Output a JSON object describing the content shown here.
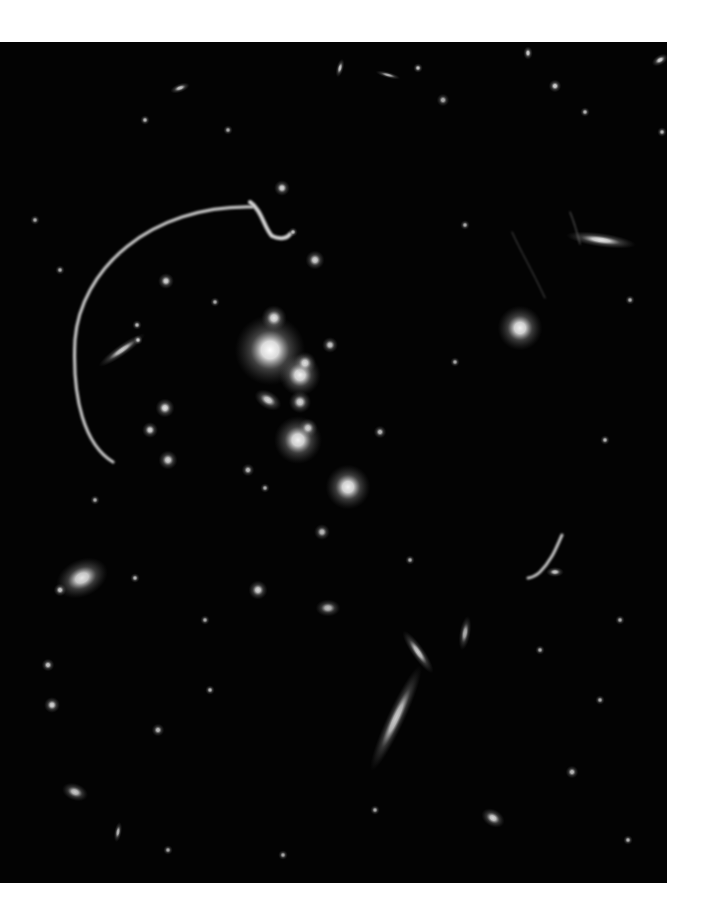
{
  "image": {
    "subject": "galaxy cluster with gravitational lensing arcs",
    "background_color": "#030303",
    "page_color": "#ffffff",
    "frame": {
      "x": 0,
      "y": 42,
      "width": 667,
      "height": 841
    }
  },
  "galaxies": [
    {
      "x": 270,
      "y": 350,
      "r": 22,
      "rx": 1,
      "ry": 1,
      "rot": 0,
      "b": 1.0
    },
    {
      "x": 300,
      "y": 375,
      "r": 13,
      "rx": 1,
      "ry": 1,
      "rot": 0,
      "b": 0.95
    },
    {
      "x": 298,
      "y": 440,
      "r": 15,
      "rx": 1,
      "ry": 1,
      "rot": 0,
      "b": 0.95
    },
    {
      "x": 348,
      "y": 487,
      "r": 14,
      "rx": 1,
      "ry": 1,
      "rot": 0,
      "b": 0.95
    },
    {
      "x": 520,
      "y": 328,
      "r": 14,
      "rx": 1,
      "ry": 1,
      "rot": 0,
      "b": 0.95
    },
    {
      "x": 274,
      "y": 318,
      "r": 8,
      "rx": 1,
      "ry": 1,
      "rot": 0,
      "b": 0.9
    },
    {
      "x": 305,
      "y": 363,
      "r": 7,
      "rx": 1,
      "ry": 1,
      "rot": 0,
      "b": 0.85
    },
    {
      "x": 268,
      "y": 400,
      "r": 7,
      "rx": 1.3,
      "ry": 0.8,
      "rot": 30,
      "b": 0.85
    },
    {
      "x": 300,
      "y": 402,
      "r": 7,
      "rx": 1,
      "ry": 1,
      "rot": 0,
      "b": 0.85
    },
    {
      "x": 308,
      "y": 428,
      "r": 6,
      "rx": 1,
      "ry": 1,
      "rot": 0,
      "b": 0.8
    },
    {
      "x": 330,
      "y": 345,
      "r": 5,
      "rx": 1,
      "ry": 1,
      "rot": 0,
      "b": 0.8
    },
    {
      "x": 165,
      "y": 408,
      "r": 6,
      "rx": 1,
      "ry": 1,
      "rot": 0,
      "b": 0.9
    },
    {
      "x": 150,
      "y": 430,
      "r": 5,
      "rx": 1,
      "ry": 1,
      "rot": 0,
      "b": 0.85
    },
    {
      "x": 168,
      "y": 460,
      "r": 6,
      "rx": 1,
      "ry": 1,
      "rot": 0,
      "b": 0.85
    },
    {
      "x": 166,
      "y": 281,
      "r": 5,
      "rx": 1,
      "ry": 1,
      "rot": 0,
      "b": 0.85
    },
    {
      "x": 122,
      "y": 350,
      "r": 8,
      "rx": 2.2,
      "ry": 0.45,
      "rot": -35,
      "b": 0.8
    },
    {
      "x": 138,
      "y": 340,
      "r": 3,
      "rx": 1,
      "ry": 1,
      "rot": 0,
      "b": 0.8
    },
    {
      "x": 137,
      "y": 325,
      "r": 3,
      "rx": 1,
      "ry": 1,
      "rot": 0,
      "b": 0.75
    },
    {
      "x": 215,
      "y": 302,
      "r": 3,
      "rx": 1,
      "ry": 1,
      "rot": 0,
      "b": 0.7
    },
    {
      "x": 315,
      "y": 260,
      "r": 6,
      "rx": 1,
      "ry": 1,
      "rot": 0,
      "b": 0.85
    },
    {
      "x": 282,
      "y": 188,
      "r": 5,
      "rx": 1,
      "ry": 1,
      "rot": 0,
      "b": 0.85
    },
    {
      "x": 293,
      "y": 232,
      "r": 3,
      "rx": 1,
      "ry": 1,
      "rot": 0,
      "b": 0.75
    },
    {
      "x": 82,
      "y": 578,
      "r": 13,
      "rx": 1.3,
      "ry": 0.9,
      "rot": -25,
      "b": 0.9
    },
    {
      "x": 60,
      "y": 590,
      "r": 4,
      "rx": 1,
      "ry": 1,
      "rot": 0,
      "b": 0.8
    },
    {
      "x": 135,
      "y": 578,
      "r": 3,
      "rx": 1,
      "ry": 1,
      "rot": 0,
      "b": 0.75
    },
    {
      "x": 601,
      "y": 240,
      "r": 10,
      "rx": 2.2,
      "ry": 0.45,
      "rot": 8,
      "b": 0.9
    },
    {
      "x": 396,
      "y": 718,
      "r": 14,
      "rx": 2.6,
      "ry": 0.4,
      "rot": -65,
      "b": 0.8
    },
    {
      "x": 418,
      "y": 652,
      "r": 8,
      "rx": 2.0,
      "ry": 0.5,
      "rot": 55,
      "b": 0.8
    },
    {
      "x": 465,
      "y": 633,
      "r": 6,
      "rx": 0.6,
      "ry": 1.8,
      "rot": 10,
      "b": 0.7
    },
    {
      "x": 555,
      "y": 572,
      "r": 4,
      "rx": 1.4,
      "ry": 0.8,
      "rot": 0,
      "b": 0.8
    },
    {
      "x": 258,
      "y": 590,
      "r": 6,
      "rx": 1,
      "ry": 1,
      "rot": 0,
      "b": 0.85
    },
    {
      "x": 328,
      "y": 608,
      "r": 6,
      "rx": 1.3,
      "ry": 0.9,
      "rot": 0,
      "b": 0.75
    },
    {
      "x": 322,
      "y": 532,
      "r": 5,
      "rx": 1,
      "ry": 1,
      "rot": 0,
      "b": 0.75
    },
    {
      "x": 380,
      "y": 432,
      "r": 4,
      "rx": 1,
      "ry": 1,
      "rot": 0,
      "b": 0.75
    },
    {
      "x": 180,
      "y": 88,
      "r": 4,
      "rx": 1.6,
      "ry": 0.7,
      "rot": -20,
      "b": 0.8
    },
    {
      "x": 340,
      "y": 68,
      "r": 4,
      "rx": 0.6,
      "ry": 1.5,
      "rot": 15,
      "b": 0.8
    },
    {
      "x": 388,
      "y": 75,
      "r": 4,
      "rx": 2.0,
      "ry": 0.5,
      "rot": 15,
      "b": 0.7
    },
    {
      "x": 418,
      "y": 68,
      "r": 3,
      "rx": 1,
      "ry": 1,
      "rot": 0,
      "b": 0.8
    },
    {
      "x": 528,
      "y": 53,
      "r": 3,
      "rx": 1,
      "ry": 1.4,
      "rot": 0,
      "b": 0.85
    },
    {
      "x": 660,
      "y": 60,
      "r": 4,
      "rx": 1.4,
      "ry": 0.8,
      "rot": -30,
      "b": 0.85
    },
    {
      "x": 555,
      "y": 86,
      "r": 4,
      "rx": 1,
      "ry": 1,
      "rot": 0,
      "b": 0.85
    },
    {
      "x": 443,
      "y": 100,
      "r": 4,
      "rx": 1,
      "ry": 1,
      "rot": 0,
      "b": 0.7
    },
    {
      "x": 145,
      "y": 120,
      "r": 3,
      "rx": 1,
      "ry": 1,
      "rot": 0,
      "b": 0.75
    },
    {
      "x": 228,
      "y": 130,
      "r": 3,
      "rx": 1,
      "ry": 1,
      "rot": 0,
      "b": 0.7
    },
    {
      "x": 585,
      "y": 112,
      "r": 3,
      "rx": 1,
      "ry": 1,
      "rot": 0,
      "b": 0.75
    },
    {
      "x": 662,
      "y": 132,
      "r": 3,
      "rx": 1,
      "ry": 1,
      "rot": 0,
      "b": 0.75
    },
    {
      "x": 605,
      "y": 440,
      "r": 3,
      "rx": 1,
      "ry": 1,
      "rot": 0,
      "b": 0.75
    },
    {
      "x": 465,
      "y": 225,
      "r": 3,
      "rx": 1,
      "ry": 1,
      "rot": 0,
      "b": 0.7
    },
    {
      "x": 455,
      "y": 362,
      "r": 3,
      "rx": 1,
      "ry": 1,
      "rot": 0,
      "b": 0.7
    },
    {
      "x": 52,
      "y": 705,
      "r": 5,
      "rx": 1,
      "ry": 1,
      "rot": 0,
      "b": 0.85
    },
    {
      "x": 48,
      "y": 665,
      "r": 4,
      "rx": 1,
      "ry": 1,
      "rot": 0,
      "b": 0.8
    },
    {
      "x": 75,
      "y": 792,
      "r": 6,
      "rx": 1.4,
      "ry": 0.9,
      "rot": 20,
      "b": 0.8
    },
    {
      "x": 118,
      "y": 832,
      "r": 4,
      "rx": 0.6,
      "ry": 1.6,
      "rot": 10,
      "b": 0.75
    },
    {
      "x": 158,
      "y": 730,
      "r": 4,
      "rx": 1,
      "ry": 1,
      "rot": 0,
      "b": 0.75
    },
    {
      "x": 210,
      "y": 690,
      "r": 3,
      "rx": 1,
      "ry": 1,
      "rot": 0,
      "b": 0.75
    },
    {
      "x": 493,
      "y": 818,
      "r": 6,
      "rx": 1.3,
      "ry": 0.9,
      "rot": 30,
      "b": 0.85
    },
    {
      "x": 572,
      "y": 772,
      "r": 4,
      "rx": 1,
      "ry": 1,
      "rot": 0,
      "b": 0.75
    },
    {
      "x": 628,
      "y": 840,
      "r": 3,
      "rx": 1,
      "ry": 1,
      "rot": 0,
      "b": 0.75
    },
    {
      "x": 600,
      "y": 700,
      "r": 3,
      "rx": 1,
      "ry": 1,
      "rot": 0,
      "b": 0.7
    },
    {
      "x": 540,
      "y": 650,
      "r": 3,
      "rx": 1,
      "ry": 1,
      "rot": 0,
      "b": 0.7
    },
    {
      "x": 168,
      "y": 850,
      "r": 3,
      "rx": 1,
      "ry": 1,
      "rot": 0,
      "b": 0.7
    },
    {
      "x": 283,
      "y": 855,
      "r": 3,
      "rx": 1,
      "ry": 1,
      "rot": 0,
      "b": 0.7
    },
    {
      "x": 375,
      "y": 810,
      "r": 3,
      "rx": 1,
      "ry": 1,
      "rot": 0,
      "b": 0.7
    },
    {
      "x": 248,
      "y": 470,
      "r": 4,
      "rx": 1,
      "ry": 1,
      "rot": 0,
      "b": 0.75
    },
    {
      "x": 265,
      "y": 488,
      "r": 3,
      "rx": 1,
      "ry": 1,
      "rot": 0,
      "b": 0.7
    },
    {
      "x": 95,
      "y": 500,
      "r": 3,
      "rx": 1,
      "ry": 1,
      "rot": 0,
      "b": 0.7
    },
    {
      "x": 35,
      "y": 220,
      "r": 3,
      "rx": 1,
      "ry": 1,
      "rot": 0,
      "b": 0.7
    },
    {
      "x": 60,
      "y": 270,
      "r": 3,
      "rx": 1,
      "ry": 1,
      "rot": 0,
      "b": 0.7
    },
    {
      "x": 630,
      "y": 300,
      "r": 3,
      "rx": 1,
      "ry": 1,
      "rot": 0,
      "b": 0.7
    },
    {
      "x": 410,
      "y": 560,
      "r": 3,
      "rx": 1,
      "ry": 1,
      "rot": 0,
      "b": 0.7
    },
    {
      "x": 205,
      "y": 620,
      "r": 3,
      "rx": 1,
      "ry": 1,
      "rot": 0,
      "b": 0.7
    },
    {
      "x": 620,
      "y": 620,
      "r": 3,
      "rx": 1,
      "ry": 1,
      "rot": 0,
      "b": 0.7
    }
  ],
  "arcs": [
    {
      "name": "giant-lensing-arc",
      "path": "M 252 207 C 150 205, 80 270, 75 340 C 72 400, 85 445, 113 462",
      "width": 3.2,
      "opacity": 0.85
    },
    {
      "name": "small-lensing-arc-top",
      "path": "M 250 202 C 262 210, 264 228, 272 236 C 280 240, 288 238, 290 234",
      "width": 4,
      "opacity": 0.9
    },
    {
      "name": "small-lensing-arc-right",
      "path": "M 562 535 C 556 548, 552 560, 540 572 C 536 576, 530 578, 528 578",
      "width": 3,
      "opacity": 0.85
    },
    {
      "name": "faint-streak-right",
      "path": "M 512 232 C 520 250, 532 270, 545 298",
      "width": 1,
      "opacity": 0.35
    },
    {
      "name": "faint-streak-upper-right",
      "path": "M 570 212 C 574 222, 577 232, 580 244",
      "width": 1,
      "opacity": 0.45
    }
  ]
}
